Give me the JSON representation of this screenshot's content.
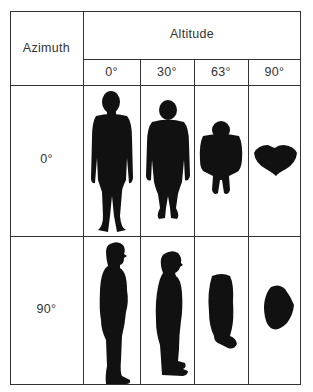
{
  "table": {
    "row_header_title": "Azimuth",
    "column_group_title": "Altitude",
    "columns": [
      "0°",
      "30°",
      "63°",
      "90°"
    ],
    "rows": [
      {
        "label": "0°",
        "silhouettes": [
          "front view standing figure at 0° altitude",
          "front view standing figure at 30° altitude",
          "foreshortened front figure at 63° altitude",
          "top view blob at 90° altitude"
        ]
      },
      {
        "label": "90°",
        "silhouettes": [
          "side view standing figure at 0° altitude",
          "side view standing figure at 30° altitude",
          "foreshortened side figure at 63° altitude",
          "top view blob at 90° altitude"
        ]
      }
    ]
  },
  "colors": {
    "ink": "#111111",
    "grid": "#333333",
    "background": "#ffffff"
  }
}
